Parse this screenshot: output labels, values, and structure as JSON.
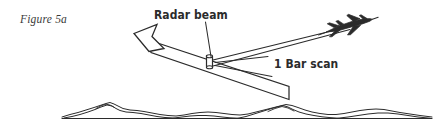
{
  "figure": {
    "label": "Figure 5a",
    "background_color": "#ffffff",
    "line_color": "#2b2b2b",
    "text_color": "#2b2b2b",
    "label_color": "#3a3a3a",
    "width": 441,
    "height": 136
  },
  "annotations": {
    "radar_beam": {
      "text": "Radar beam",
      "leader_from": [
        205,
        22
      ],
      "leader_to": [
        213,
        58
      ]
    },
    "bar_scan": {
      "text": "1 Bar scan"
    }
  },
  "elements": {
    "aircraft": {
      "name": "fighter-jet",
      "position": [
        352,
        23
      ],
      "heading": "left-descending"
    },
    "antenna": {
      "name": "radar-antenna",
      "position": [
        210,
        62
      ]
    },
    "beam_arrow": {
      "name": "beam-direction-arrow",
      "points_toward": [
        140,
        34
      ]
    },
    "scan_band": {
      "name": "one-bar-scan-band",
      "start": [
        150,
        40
      ],
      "end": [
        290,
        95
      ]
    },
    "terrain": {
      "name": "terrain-profile",
      "ground_line_y": 118,
      "left_x": 62,
      "right_x": 432
    }
  }
}
